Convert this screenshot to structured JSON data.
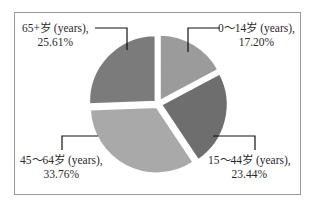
{
  "chart_data": {
    "type": "pie",
    "title": "",
    "categories": [
      "0~14岁 (years)",
      "15~44岁 (years)",
      "45~64岁 (years)",
      "65+岁 (years)"
    ],
    "values": [
      17.2,
      23.44,
      33.76,
      25.61
    ],
    "unit": "%",
    "colors": [
      "#9b9b9b",
      "#6e6e6e",
      "#a9a9a9",
      "#7b7b7b"
    ],
    "start_angle_deg": 0,
    "direction": "clockwise",
    "exploded": true,
    "legend": "none",
    "data_labels": [
      {
        "name": "0~14岁 (years),",
        "value": "17.20%"
      },
      {
        "name": "15~44岁 (years),",
        "value": "23.44%"
      },
      {
        "name": "45~64岁 (years),",
        "value": "33.76%"
      },
      {
        "name": "65+岁 (years),",
        "value": "25.61%"
      }
    ]
  },
  "labels": {
    "age_0_14": {
      "line1": "0～14岁 (years),",
      "line2": "17.20%"
    },
    "age_15_44": {
      "line1": "15～44岁 (years),",
      "line2": "23.44%"
    },
    "age_45_64": {
      "line1": "45～64岁 (years),",
      "line2": "33.76%"
    },
    "age_65_plus": {
      "line1": "65+岁 (years),",
      "line2": "25.61%"
    }
  }
}
